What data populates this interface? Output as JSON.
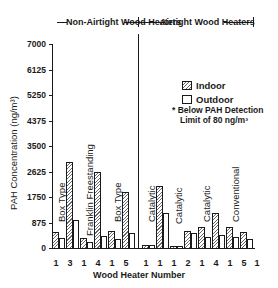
{
  "chart_data": {
    "type": "bar",
    "title": "",
    "group_headers": [
      "Non-Airtight Wood Heaters",
      "Airtight Wood Heaters"
    ],
    "xlabel": "Wood Heater Number",
    "ylabel": "PAH Concentration (ng/m³)",
    "ylim": [
      0,
      7000
    ],
    "yticks": [
      "0",
      "875",
      "1750",
      "2625",
      "3500",
      "4375",
      "5250",
      "6125",
      "7000"
    ],
    "grid": false,
    "legend_position": "upper right",
    "legend": [
      "Indoor",
      "Outdoor"
    ],
    "note": [
      "* Below PAH Detection",
      "Limit of 80 ng/m³"
    ],
    "categories": [
      "1",
      "3",
      "1",
      "4",
      "1",
      "5",
      "1",
      "1",
      "1",
      "2",
      "1",
      "4",
      "1",
      "5",
      "1"
    ],
    "category_groups": [
      "Non-Airtight",
      "Non-Airtight",
      "Non-Airtight",
      "Non-Airtight",
      "Non-Airtight",
      "Non-Airtight",
      "Airtight",
      "Airtight",
      "Airtight",
      "Airtight",
      "Airtight",
      "Airtight",
      "Airtight",
      "Airtight",
      "Airtight"
    ],
    "type_labels": [
      {
        "label": "Box Type",
        "over": "3"
      },
      {
        "label": "Franklin Freestanding",
        "over": "4"
      },
      {
        "label": "Box Type",
        "over": "5"
      },
      {
        "label": "Catalytic",
        "over": "1"
      },
      {
        "label": "Catalytic",
        "over": "2"
      },
      {
        "label": "Catalytic",
        "over": "4"
      },
      {
        "label": "Conventional",
        "over": "5"
      }
    ],
    "series": [
      {
        "name": "Indoor",
        "values": [
          550,
          2950,
          340,
          2600,
          580,
          1920,
          100,
          2130,
          80,
          580,
          720,
          1200,
          720,
          550,
          null
        ]
      },
      {
        "name": "Outdoor",
        "values": [
          340,
          960,
          210,
          410,
          310,
          510,
          100,
          1200,
          80,
          510,
          380,
          450,
          380,
          310,
          null
        ]
      }
    ]
  }
}
